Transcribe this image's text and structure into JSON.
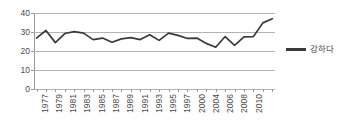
{
  "chart_data": {
    "type": "line",
    "title": "",
    "subtitle": "",
    "xlabel": "",
    "ylabel": "",
    "ylim": [
      0,
      40
    ],
    "yticks": [
      0,
      10,
      20,
      30,
      40
    ],
    "grid": true,
    "legend_position": "right",
    "x_tick_labels": [
      "1977",
      "1979",
      "1981",
      "1983",
      "1985",
      "1987",
      "1989",
      "1991",
      "1993",
      "1995",
      "1997",
      "2000",
      "2004",
      "2006",
      "2008",
      "2010"
    ],
    "x": [
      "1977",
      "1978",
      "1979",
      "1980",
      "1981",
      "1982",
      "1983",
      "1984",
      "1985",
      "1986",
      "1987",
      "1988",
      "1989",
      "1990",
      "1991",
      "1993",
      "1994",
      "1996",
      "1998",
      "2000",
      "2002",
      "2004",
      "2006",
      "2008",
      "2010",
      "2012"
    ],
    "categories": [
      "1977",
      "1978",
      "1979",
      "1980",
      "1981",
      "1982",
      "1983",
      "1984",
      "1985",
      "1986",
      "1987",
      "1988",
      "1989",
      "1990",
      "1991",
      "1993",
      "1994",
      "1996",
      "1998",
      "2000",
      "2002",
      "2004",
      "2006",
      "2008",
      "2010",
      "2012"
    ],
    "series": [
      {
        "name": "강하다",
        "color": "#3a3a3a",
        "values": [
          26.8,
          30.8,
          24.4,
          29.2,
          30.2,
          29.4,
          26.0,
          26.8,
          24.6,
          26.4,
          27.0,
          26.0,
          28.6,
          25.6,
          29.4,
          28.2,
          26.6,
          26.8,
          24.0,
          22.0,
          27.6,
          23.0,
          27.4,
          27.6,
          34.8,
          37.0
        ]
      }
    ],
    "values": [
      26.8,
      30.8,
      24.4,
      29.2,
      30.2,
      29.4,
      26.0,
      26.8,
      24.6,
      26.4,
      27.0,
      26.0,
      28.6,
      25.6,
      29.4,
      28.2,
      26.6,
      26.8,
      24.0,
      22.0,
      27.6,
      23.0,
      27.4,
      27.6,
      34.8,
      37.0
    ]
  },
  "legend": {
    "label": "강하다"
  },
  "axis": {
    "y_labels": [
      "40",
      "30",
      "20",
      "10",
      "0"
    ],
    "x_labels": [
      "1977",
      "1979",
      "1981",
      "1983",
      "1985",
      "1987",
      "1989",
      "1991",
      "1993",
      "1995",
      "1997",
      "2000",
      "2004",
      "2006",
      "2008",
      "2010"
    ]
  },
  "colors": {
    "series": "#3a3a3a",
    "grid": "#b3b3b3",
    "axis": "#9a9a9a",
    "text": "#4a4a4a",
    "background": "#ffffff"
  }
}
